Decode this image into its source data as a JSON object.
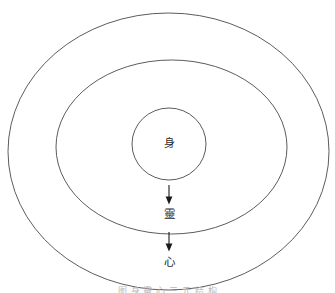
{
  "canvas": {
    "width": 335,
    "height": 293,
    "background_color": "#ffffff",
    "stroke_color": "#4a4a4a",
    "text_color": "#2b2b2b"
  },
  "diagram": {
    "type": "concentric-ellipse-nested-model",
    "rings": [
      {
        "id": "outer-ring",
        "name": "outer-ellipse",
        "cx": 168.5,
        "cy": 151.5,
        "rx": 160.5,
        "ry": 138.5
      },
      {
        "id": "middle-ring",
        "name": "middle-ellipse",
        "cx": 171.5,
        "cy": 147.0,
        "rx": 115.5,
        "ry": 87.0
      },
      {
        "id": "inner-ring",
        "name": "inner-ellipse",
        "cx": 169.0,
        "cy": 144.0,
        "rx": 37.0,
        "ry": 36.0
      }
    ],
    "labels": [
      {
        "id": "label-shen",
        "text": "身",
        "x": 169,
        "y": 143,
        "ring": "inner-ring"
      },
      {
        "id": "label-ling",
        "text": "靈",
        "x": 169,
        "y": 214,
        "ring": "middle-ring"
      },
      {
        "id": "label-xin",
        "text": "心",
        "x": 169,
        "y": 262,
        "ring": "outer-ring"
      }
    ],
    "arrows": [
      {
        "id": "arrow-shen-to-ling",
        "from": "label-shen",
        "to": "label-ling",
        "x": 169,
        "y_start": 185,
        "y_end": 204,
        "direction": "down"
      },
      {
        "id": "arrow-ling-to-xin",
        "from": "label-ling",
        "to": "label-xin",
        "x": 169,
        "y_start": 232,
        "y_end": 251,
        "direction": "down"
      }
    ]
  },
  "caption": {
    "text": "图 身 靈 心 三 元 结 构",
    "visibility": "clipped-at-bottom-edge"
  }
}
